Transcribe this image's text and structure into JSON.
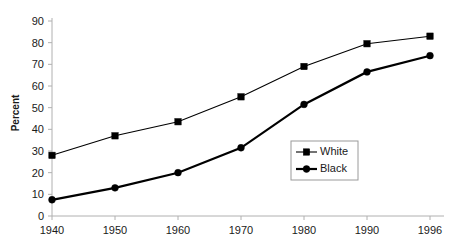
{
  "chart_data": {
    "type": "line",
    "title": "",
    "xlabel": "",
    "ylabel": "Percent",
    "categories": [
      "1940",
      "1950",
      "1960",
      "1970",
      "1980",
      "1990",
      "1996"
    ],
    "ylim": [
      0,
      90
    ],
    "yticks": [
      "0",
      "10",
      "20",
      "30",
      "40",
      "50",
      "60",
      "70",
      "80",
      "90"
    ],
    "grid": false,
    "legend_position": "center-right-lower",
    "series": [
      {
        "name": "White",
        "marker": "square",
        "values": [
          28,
          37,
          43.5,
          55,
          69,
          79.5,
          83
        ]
      },
      {
        "name": "Black",
        "marker": "circle",
        "values": [
          7.5,
          13,
          20,
          31.5,
          51.5,
          66.5,
          74
        ]
      }
    ]
  },
  "legend": {
    "entries": [
      {
        "label": "White"
      },
      {
        "label": "Black"
      }
    ]
  },
  "colors": {
    "series": "#000000",
    "axis": "#b0b0b0",
    "text": "#1a1a1a",
    "background": "#ffffff"
  }
}
